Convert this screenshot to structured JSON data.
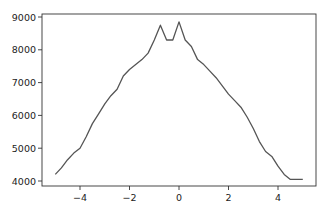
{
  "chart_data": {
    "type": "line",
    "title": "",
    "xlabel": "",
    "ylabel": "",
    "xlim": [
      -5.4,
      5.4
    ],
    "ylim": [
      3800,
      9050
    ],
    "grid": false,
    "legend": null,
    "x_ticks": [
      -4,
      -2,
      0,
      2,
      4
    ],
    "x_tick_labels": [
      "−4",
      "−2",
      "0",
      "2",
      "4"
    ],
    "y_ticks": [
      4000,
      5000,
      6000,
      7000,
      8000,
      9000
    ],
    "y_tick_labels": [
      "4000",
      "5000",
      "6000",
      "7000",
      "8000",
      "9000"
    ],
    "series": [
      {
        "name": "series",
        "color": "#555555",
        "x": [
          -5.0,
          -4.75,
          -4.5,
          -4.25,
          -4.0,
          -3.75,
          -3.5,
          -3.25,
          -3.0,
          -2.75,
          -2.5,
          -2.25,
          -2.0,
          -1.75,
          -1.5,
          -1.25,
          -1.0,
          -0.75,
          -0.5,
          -0.25,
          0.0,
          0.25,
          0.5,
          0.75,
          1.0,
          1.25,
          1.5,
          1.75,
          2.0,
          2.25,
          2.5,
          2.75,
          3.0,
          3.25,
          3.5,
          3.75,
          4.0,
          4.25,
          4.5,
          4.75,
          5.0
        ],
        "values": [
          4200,
          4400,
          4650,
          4850,
          5000,
          5350,
          5750,
          6050,
          6350,
          6600,
          6800,
          7200,
          7400,
          7550,
          7700,
          7900,
          8300,
          8750,
          8300,
          8300,
          8850,
          8300,
          8100,
          7700,
          7550,
          7350,
          7150,
          6900,
          6650,
          6450,
          6250,
          5950,
          5600,
          5200,
          4900,
          4750,
          4450,
          4200,
          4050,
          4050,
          4050
        ]
      }
    ]
  }
}
